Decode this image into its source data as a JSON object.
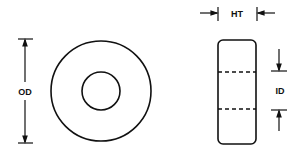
{
  "diagram": {
    "type": "toroid-core-dimension-drawing",
    "labels": {
      "outer_diameter": "OD",
      "height": "HT",
      "inner_diameter": "ID"
    },
    "views": [
      "front-view",
      "side-view"
    ],
    "colors": {
      "stroke": "#111111",
      "background": "#ffffff"
    }
  }
}
